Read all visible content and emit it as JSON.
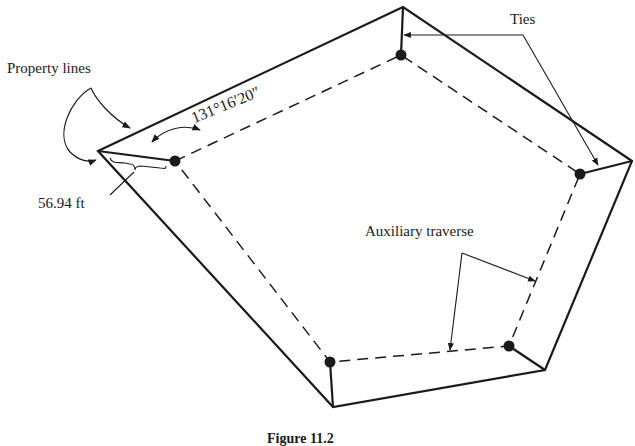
{
  "figure": {
    "caption": "Figure 11.2",
    "colors": {
      "ink": "#1a1a1a",
      "background": "#ffffff"
    }
  },
  "labels": {
    "property_lines": "Property lines",
    "ties": "Ties",
    "auxiliary_traverse": "Auxiliary traverse",
    "tie_distance": "56.94 ft",
    "tie_angle": "131°16′20″"
  },
  "geometry": {
    "property_polygon": [
      [
        98,
        151
      ],
      [
        403,
        7
      ],
      [
        632,
        161
      ],
      [
        545,
        370
      ],
      [
        333,
        407
      ]
    ],
    "traverse_polygon": [
      [
        175,
        161
      ],
      [
        401,
        55
      ],
      [
        580,
        174
      ],
      [
        509,
        346
      ],
      [
        330,
        362
      ]
    ],
    "ties": [
      [
        [
          98,
          151
        ],
        [
          175,
          161
        ]
      ],
      [
        [
          403,
          7
        ],
        [
          401,
          55
        ]
      ],
      [
        [
          632,
          161
        ],
        [
          580,
          174
        ]
      ],
      [
        [
          545,
          370
        ],
        [
          509,
          346
        ]
      ],
      [
        [
          333,
          407
        ],
        [
          330,
          362
        ]
      ]
    ]
  }
}
